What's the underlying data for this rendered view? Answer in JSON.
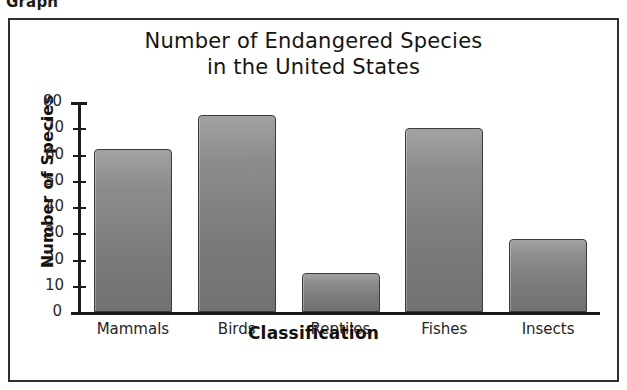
{
  "caption": "Graph",
  "chart_data": {
    "type": "bar",
    "title": "Number of Endangered Species in the United States",
    "title_lines": [
      "Number of Endangered Species",
      "in the United States"
    ],
    "xlabel": "Classification",
    "ylabel": "Number of Species",
    "categories": [
      "Mammals",
      "Birds",
      "Reptiles",
      "Fishes",
      "Insects"
    ],
    "values": [
      62,
      75,
      15,
      70,
      28
    ],
    "ylim": [
      0,
      80
    ],
    "ytick_labels": [
      "0",
      "10",
      "20",
      "30",
      "40",
      "50",
      "60",
      "70",
      "80"
    ],
    "yticks": [
      0,
      10,
      20,
      30,
      40,
      50,
      60,
      70,
      80
    ],
    "grid": false,
    "legend": null,
    "bar_color": "#7f7f7f",
    "bar_border_color": "#3b3b3b",
    "axis_color": "#1a1a1a"
  }
}
